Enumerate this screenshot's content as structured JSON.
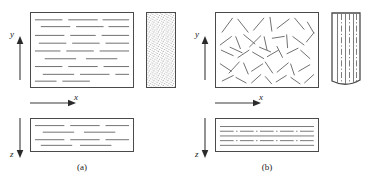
{
  "figure": {
    "panels": [
      {
        "id": "a",
        "caption": "(a)",
        "description": "Continuous and aligned fiber composite",
        "axes": {
          "y": {
            "label": "y",
            "direction": "up"
          },
          "x": {
            "label": "x",
            "direction": "right"
          },
          "z": {
            "label": "z",
            "direction": "down"
          }
        },
        "views": {
          "front": {
            "name": "xy-front-view",
            "pattern": "aligned-horizontal-fibers",
            "line_style": "long-dash",
            "fiber_count": 26
          },
          "side": {
            "name": "yz-side-view",
            "pattern": "stippled-fiber-cross-sections",
            "dot_count": 520
          },
          "bottom": {
            "name": "xz-bottom-view",
            "pattern": "aligned-horizontal-fibers",
            "line_style": "long-dash",
            "fiber_count": 9
          }
        }
      },
      {
        "id": "b",
        "caption": "(b)",
        "description": "Discontinuous and randomly oriented fiber composite",
        "axes": {
          "y": {
            "label": "y",
            "direction": "up"
          },
          "x": {
            "label": "x",
            "direction": "right"
          },
          "z": {
            "label": "z",
            "direction": "down"
          }
        },
        "views": {
          "front": {
            "name": "xy-front-view",
            "pattern": "random-oriented-short-fibers",
            "line_style": "solid",
            "fiber_count": 44
          },
          "side": {
            "name": "yz-side-view",
            "pattern": "vertical-dash-dot-fibers",
            "line_style": "dash-dot",
            "fiber_count": 7,
            "shape": "skewed-bottom"
          },
          "bottom": {
            "name": "xz-bottom-view",
            "pattern": "horizontal-dash-dot-fibers",
            "line_style": "dash-dot",
            "fiber_count": 6
          }
        }
      }
    ],
    "colors": {
      "stroke": "#4a4a4a",
      "fiber": "#6b6b6b",
      "background": "#ffffff",
      "text": "#1a1a1a"
    }
  }
}
